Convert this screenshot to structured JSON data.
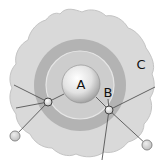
{
  "diagram": {
    "labels": {
      "a": "A",
      "b": "B",
      "c": "C"
    },
    "colors": {
      "background": "#ffffff",
      "outer_region": "#d9d9d9",
      "outer_region_stroke": "#c4c4c4",
      "middle_ring": "#b3b3b3",
      "inner_ring": "#cdcdcd",
      "inner_ring_outline": "#e6e6e6",
      "core_light": "#fbfbfb",
      "core_dark": "#9a9a9a",
      "line": "#555555",
      "node_fill": "#ffffff",
      "node_stroke": "#555555",
      "outer_node_fill": "#dcdcdc",
      "outer_node_stroke": "#888888",
      "text": "#111111"
    }
  }
}
